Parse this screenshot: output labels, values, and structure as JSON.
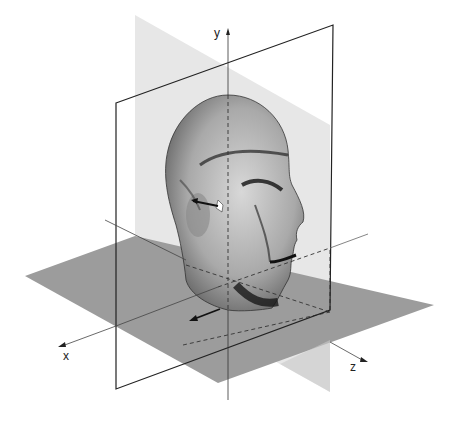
{
  "diagram": {
    "axes": {
      "x": {
        "label": "x"
      },
      "y": {
        "label": "y"
      },
      "z": {
        "label": "z"
      }
    },
    "planes": {
      "horizontal": {
        "name": "horizontal-plane",
        "color": "#9a9a9a"
      },
      "sagittal": {
        "name": "sagittal-plane",
        "color": "#e6e6e6"
      },
      "coronal": {
        "name": "coronal-plane-frame",
        "color": "#222222"
      }
    },
    "arrows": [
      {
        "name": "ear-arrow",
        "direction": "toward -z along ear"
      },
      {
        "name": "floor-arrow",
        "direction": "toward +x on horizontal plane"
      }
    ]
  }
}
